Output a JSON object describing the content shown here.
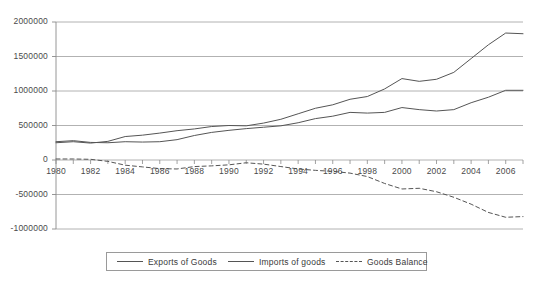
{
  "chart_data": {
    "type": "line",
    "title": "",
    "xlabel": "",
    "ylabel": "",
    "grid": true,
    "legend_position": "bottom",
    "xlim": [
      1980,
      2007
    ],
    "ylim": [
      -1000000,
      2000000
    ],
    "x_tick_labels": [
      "1980",
      "1982",
      "1984",
      "1986",
      "1988",
      "1990",
      "1992",
      "1994",
      "1996",
      "1998",
      "2000",
      "2002",
      "2004",
      "2006"
    ],
    "x_ticks": [
      1980,
      1982,
      1984,
      1986,
      1988,
      1990,
      1992,
      1994,
      1996,
      1998,
      2000,
      2002,
      2004,
      2006
    ],
    "y_tick_labels": [
      "2000000",
      "1500000",
      "1000000",
      "500000",
      "0",
      "-500000",
      "-1000000"
    ],
    "y_ticks": [
      2000000,
      1500000,
      1000000,
      500000,
      0,
      -500000,
      -1000000
    ],
    "x": [
      1980,
      1981,
      1982,
      1983,
      1984,
      1985,
      1986,
      1987,
      1988,
      1989,
      1990,
      1991,
      1992,
      1993,
      1994,
      1995,
      1996,
      1997,
      1998,
      1999,
      2000,
      2001,
      2002,
      2003,
      2004,
      2005,
      2006,
      2007
    ],
    "series": [
      {
        "name": "Exports of Goods",
        "style": "solid",
        "color": "#555555",
        "values": [
          265000,
          280000,
          255000,
          250000,
          265000,
          260000,
          265000,
          295000,
          355000,
          400000,
          430000,
          455000,
          475000,
          495000,
          540000,
          600000,
          635000,
          690000,
          680000,
          690000,
          760000,
          730000,
          710000,
          730000,
          830000,
          910000,
          1010000,
          1010000
        ]
      },
      {
        "name": "Imports of goods",
        "style": "solid",
        "color": "#555555",
        "values": [
          250000,
          265000,
          245000,
          270000,
          340000,
          360000,
          390000,
          425000,
          450000,
          485000,
          500000,
          495000,
          535000,
          590000,
          670000,
          750000,
          800000,
          880000,
          920000,
          1030000,
          1180000,
          1140000,
          1170000,
          1270000,
          1470000,
          1670000,
          1840000,
          1830000
        ]
      },
      {
        "name": "Goods Balance",
        "style": "dashed",
        "color": "#555555",
        "values": [
          15000,
          15000,
          10000,
          -20000,
          -75000,
          -100000,
          -125000,
          -130000,
          -95000,
          -85000,
          -70000,
          -40000,
          -60000,
          -95000,
          -130000,
          -150000,
          -165000,
          -190000,
          -240000,
          -340000,
          -420000,
          -410000,
          -460000,
          -540000,
          -640000,
          -760000,
          -830000,
          -820000
        ]
      }
    ]
  },
  "axis": {
    "y_axis_name": "value-axis",
    "x_axis_name": "year-axis"
  }
}
